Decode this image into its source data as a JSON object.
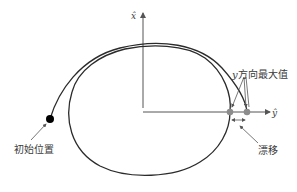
{
  "diagram": {
    "axes": {
      "x_label": "x̂",
      "y_label": "ŷ"
    },
    "annotations": {
      "initial_position": "初始位置",
      "y_max_prefix": "y",
      "y_max_suffix": "方向最大值",
      "drift": "漂移"
    },
    "colors": {
      "curve": "#2b2b2b",
      "axis": "#555555",
      "marker_gray": "#8c8c8c",
      "marker_black": "#000000",
      "text": "#3a3a3a"
    }
  }
}
